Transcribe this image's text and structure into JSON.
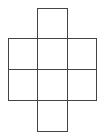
{
  "diagram": {
    "type": "cube-net",
    "stroke_color": "#444444",
    "background": "#ffffff",
    "cells": [
      {
        "id": "top",
        "x": 37,
        "y": 8,
        "w": 30,
        "h": 30
      },
      {
        "id": "r1c1",
        "x": 8,
        "y": 38,
        "w": 29,
        "h": 31
      },
      {
        "id": "r1c2",
        "x": 37,
        "y": 38,
        "w": 30,
        "h": 31
      },
      {
        "id": "r1c3",
        "x": 67,
        "y": 38,
        "w": 29,
        "h": 31
      },
      {
        "id": "r2c1",
        "x": 8,
        "y": 69,
        "w": 29,
        "h": 31
      },
      {
        "id": "r2c2",
        "x": 37,
        "y": 69,
        "w": 30,
        "h": 31
      },
      {
        "id": "r2c3",
        "x": 67,
        "y": 69,
        "w": 29,
        "h": 31
      },
      {
        "id": "bottom",
        "x": 37,
        "y": 100,
        "w": 30,
        "h": 31
      }
    ]
  }
}
